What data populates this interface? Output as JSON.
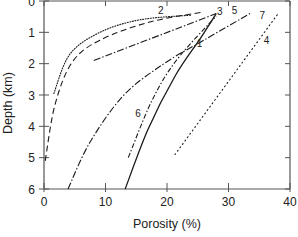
{
  "chart_data": {
    "type": "line",
    "title": "",
    "xlabel": "Porosity (%)",
    "ylabel": "Depth (km)",
    "xlim": [
      0,
      40
    ],
    "ylim": [
      0,
      6
    ],
    "y_inverted": true,
    "x_ticks": [
      "0",
      "10",
      "20",
      "30",
      "40"
    ],
    "y_ticks": [
      "0",
      "1",
      "2",
      "3",
      "4",
      "5",
      "6"
    ],
    "grid": false,
    "legend": "none (curves labeled inline by number)",
    "series": [
      {
        "name": "1",
        "style": "solid",
        "x": [
          28.0,
          25.4,
          21.3,
          16.9,
          13.2
        ],
        "y": [
          0.4,
          1.2,
          2.4,
          4.1,
          6.0
        ]
      },
      {
        "name": "2",
        "style": "dotted",
        "x": [
          1.6,
          4.2,
          9.1,
          15.6,
          24.0
        ],
        "y": [
          2.95,
          1.7,
          1.0,
          0.6,
          0.45
        ]
      },
      {
        "name": "3",
        "style": "dashed",
        "x": [
          0.2,
          1.8,
          4.6,
          9.1,
          17.2,
          26.0
        ],
        "y": [
          5.1,
          3.3,
          1.95,
          1.25,
          0.67,
          0.35
        ]
      },
      {
        "name": "4",
        "style": "dotted-sparse",
        "x": [
          21.3,
          38.0
        ],
        "y": [
          4.9,
          0.42
        ]
      },
      {
        "name": "5",
        "style": "dash-dot",
        "x": [
          8.1,
          28.0
        ],
        "y": [
          1.9,
          0.4
        ]
      },
      {
        "name": "6",
        "style": "dash-dot-dot",
        "x": [
          13.7,
          17.5,
          21.5,
          28.0
        ],
        "y": [
          5.0,
          3.2,
          1.9,
          0.48
        ]
      },
      {
        "name": "7",
        "style": "dash-dot",
        "x": [
          3.9,
          7.5,
          13.0,
          19.5,
          26.0,
          33.5
        ],
        "y": [
          6.0,
          4.5,
          3.0,
          2.0,
          1.25,
          0.4
        ]
      }
    ],
    "labels": [
      {
        "text": "1",
        "x": 25.3,
        "y": 1.35
      },
      {
        "text": "2",
        "x": 19.0,
        "y": 0.3
      },
      {
        "text": "3",
        "x": 28.6,
        "y": 0.35
      },
      {
        "text": "4",
        "x": 36.2,
        "y": 1.25
      },
      {
        "text": "5",
        "x": 31.0,
        "y": 0.3
      },
      {
        "text": "6",
        "x": 15.3,
        "y": 3.6
      },
      {
        "text": "7",
        "x": 35.5,
        "y": 0.45
      }
    ]
  }
}
